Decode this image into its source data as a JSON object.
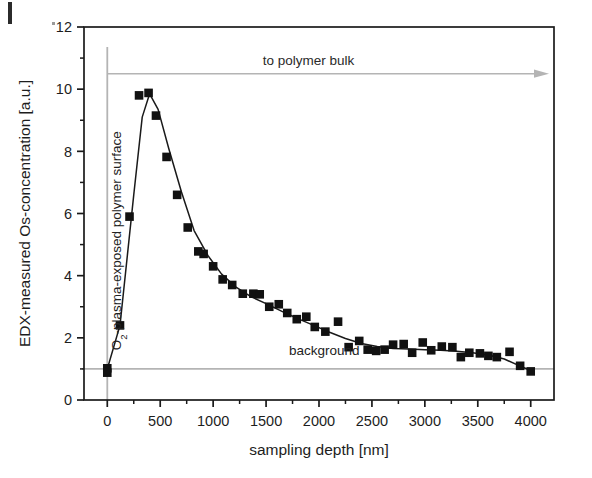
{
  "figure": {
    "background_color": "#ffffff",
    "frame_color": "#1a1a1a",
    "marker_color": "#111111",
    "curve_color": "#1a1a1a",
    "guide_color": "#b4b4b4"
  },
  "annotations": {
    "surface_line_label": "O2-plasma-exposed polymer surface",
    "surface_line_label_main": "-plasma-exposed polymer surface",
    "surface_line_label_prefix": "O",
    "surface_line_label_sub": "2",
    "bulk_arrow_label": "to polymer bulk",
    "background_label": "background"
  },
  "chart_data": {
    "type": "scatter",
    "title": "",
    "xlabel": "sampling depth [nm]",
    "ylabel": "EDX-measured Os-concentration [a.u.]",
    "xlim": [
      -220,
      4220
    ],
    "ylim": [
      0,
      12
    ],
    "xticks": [
      0,
      500,
      1000,
      1500,
      2000,
      2500,
      3000,
      3500,
      4000
    ],
    "xtick_labels": [
      "0",
      "500",
      "1000",
      "1500",
      "2000",
      "2500",
      "3000",
      "3500",
      "4000"
    ],
    "xminor_step": 250,
    "yticks": [
      0,
      2,
      4,
      6,
      8,
      10,
      12
    ],
    "ytick_labels": [
      "0",
      "2",
      "4",
      "6",
      "8",
      "10",
      "12"
    ],
    "yminor_step": 1,
    "grid": false,
    "legend": false,
    "marker": "filled-square",
    "background_level": 1.0,
    "bulk_arrow_level": 10.5,
    "surface_line_x": 0,
    "series": [
      {
        "name": "EDX-measured Os-concentration",
        "x": [
          0,
          0,
          120,
          210,
          300,
          390,
          460,
          560,
          660,
          760,
          860,
          910,
          1000,
          1090,
          1180,
          1280,
          1380,
          1440,
          1530,
          1620,
          1700,
          1790,
          1880,
          1960,
          2060,
          2180,
          2280,
          2380,
          2460,
          2540,
          2620,
          2700,
          2800,
          2880,
          2980,
          3060,
          3160,
          3260,
          3340,
          3420,
          3520,
          3600,
          3680,
          3800,
          3900,
          4000
        ],
        "y": [
          1.02,
          0.88,
          2.4,
          5.9,
          9.8,
          9.88,
          9.15,
          7.82,
          6.6,
          5.55,
          4.78,
          4.7,
          4.3,
          3.88,
          3.7,
          3.42,
          3.42,
          3.4,
          3.0,
          3.08,
          2.8,
          2.6,
          2.68,
          2.35,
          2.2,
          2.52,
          1.7,
          1.9,
          1.62,
          1.58,
          1.62,
          1.78,
          1.8,
          1.52,
          1.85,
          1.6,
          1.72,
          1.7,
          1.38,
          1.52,
          1.5,
          1.42,
          1.38,
          1.55,
          1.1,
          0.92
        ]
      }
    ],
    "fit_curve": {
      "name": "smoothed fit",
      "x": [
        0,
        120,
        250,
        330,
        400,
        480,
        580,
        700,
        820,
        950,
        1080,
        1220,
        1360,
        1500,
        1650,
        1800,
        1950,
        2100,
        2250,
        2400,
        2550,
        2700,
        2850,
        3000,
        3150,
        3300,
        3450,
        3600,
        3750,
        3880,
        4000
      ],
      "y": [
        1.0,
        2.4,
        6.6,
        9.1,
        9.85,
        9.35,
        8.1,
        6.7,
        5.45,
        4.65,
        4.05,
        3.62,
        3.32,
        3.1,
        2.85,
        2.62,
        2.4,
        2.18,
        1.98,
        1.82,
        1.72,
        1.66,
        1.64,
        1.62,
        1.6,
        1.57,
        1.52,
        1.45,
        1.32,
        1.12,
        0.95
      ]
    }
  }
}
